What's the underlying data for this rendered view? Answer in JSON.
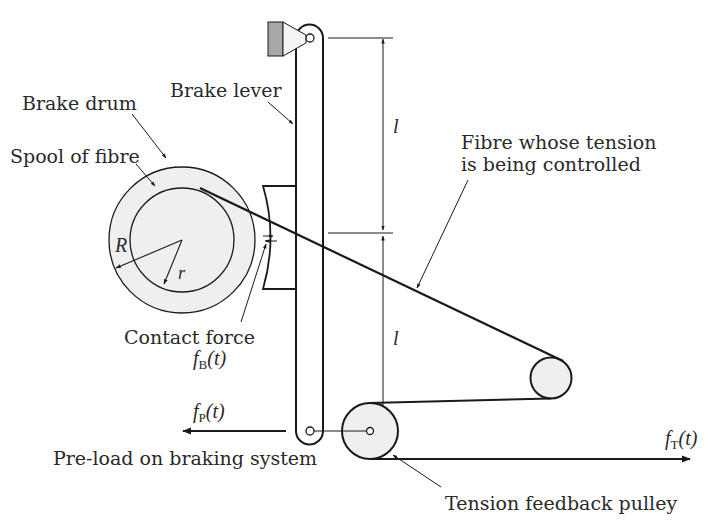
{
  "diagram": {
    "labels": {
      "brake_drum": "Brake drum",
      "spool": "Spool of fibre",
      "brake_lever": "Brake lever",
      "fibre_line1": "Fibre whose tension",
      "fibre_line2": "is being controlled",
      "contact_force": "Contact force",
      "preload": "Pre-load on braking system",
      "tension_pulley": "Tension feedback pulley"
    },
    "symbols": {
      "R": "R",
      "r": "r",
      "l_upper": "l",
      "l_lower": "l",
      "fB_f": "f",
      "fB_sub": "B",
      "fB_arg": "(t)",
      "fP_f": "f",
      "fP_sub": "P",
      "fP_arg": "(t)",
      "fT_f": "f",
      "fT_sub": "T",
      "fT_arg": "(t)"
    },
    "colors": {
      "stroke": "#1a1a1a",
      "fill_light": "#efefef",
      "mount_fill": "#a8a8a8",
      "text": "#2a2a2a"
    }
  }
}
